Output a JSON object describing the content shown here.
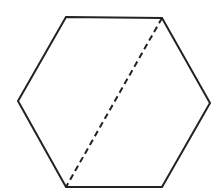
{
  "diagram": {
    "shape": "hexagon",
    "stroke_color": "#222222",
    "background": "#ffffff",
    "hexagon": {
      "vertices": [
        [
          66,
          17
        ],
        [
          162,
          18
        ],
        [
          210,
          103
        ],
        [
          162,
          187
        ],
        [
          66,
          187
        ],
        [
          18,
          101
        ]
      ],
      "stroke_width": 2
    },
    "diagonal": {
      "style": "dashed",
      "from": [
        162,
        18
      ],
      "to": [
        66,
        187
      ],
      "stroke_width": 2,
      "dash": "6,4"
    }
  }
}
